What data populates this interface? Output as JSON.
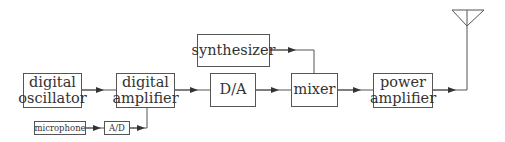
{
  "diagram": {
    "type": "block-diagram",
    "blocks": {
      "digital_oscillator": {
        "line1": "digital",
        "line2": "oscillator"
      },
      "digital_amplifier": {
        "line1": "digital",
        "line2": "amplifier"
      },
      "da": {
        "label": "D/A"
      },
      "synthesizer": {
        "label": "synthesizer"
      },
      "mixer": {
        "label": "mixer"
      },
      "power_amplifier": {
        "line1": "power",
        "line2": "amplifier"
      },
      "microphone": {
        "label": "microphone"
      },
      "ad": {
        "label": "A/D"
      }
    },
    "connections": [
      [
        "digital oscillator",
        "digital amplifier"
      ],
      [
        "microphone",
        "A/D"
      ],
      [
        "A/D",
        "digital amplifier"
      ],
      [
        "digital amplifier",
        "D/A"
      ],
      [
        "D/A",
        "mixer"
      ],
      [
        "synthesizer",
        "mixer"
      ],
      [
        "mixer",
        "power amplifier"
      ],
      [
        "power amplifier",
        "antenna"
      ]
    ],
    "antenna": "antenna-icon",
    "colors": {
      "line": "#555555",
      "text": "#333333",
      "background": "#ffffff"
    }
  }
}
